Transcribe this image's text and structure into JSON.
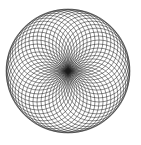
{
  "figure": {
    "center": [
      68,
      71
    ],
    "ring_radius": 31,
    "circle_radius": 31,
    "circle_count": 48,
    "stroke_color": "#1a1a1a",
    "background": "#ffffff"
  }
}
